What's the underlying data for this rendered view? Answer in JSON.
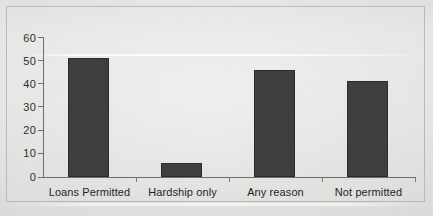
{
  "chart_data": {
    "type": "bar",
    "title": "",
    "subtitle": "",
    "xlabel": "",
    "ylabel": "",
    "categories": [
      "Loans Permitted",
      "Hardship only",
      "Any reason",
      "Not permitted"
    ],
    "values": [
      51,
      6,
      46,
      41
    ],
    "ylim": [
      0,
      60
    ],
    "yticks": [
      0,
      10,
      20,
      30,
      40,
      50,
      60
    ],
    "ytick_labels": [
      "0",
      "10",
      "20",
      "30",
      "40",
      "50",
      "60"
    ],
    "grid": false,
    "legend": null,
    "legend_position": "none",
    "annotations": [],
    "series": [
      {
        "name": "",
        "values": [
          51,
          6,
          46,
          41
        ],
        "color": "#3c3c3c"
      }
    ],
    "colors": {
      "bar_fill": "#3c3c3c",
      "bar_edge": "#2a2a2a",
      "axis": "#6e6e6c",
      "background": "#dededc",
      "text": "#1f1f1f"
    }
  }
}
